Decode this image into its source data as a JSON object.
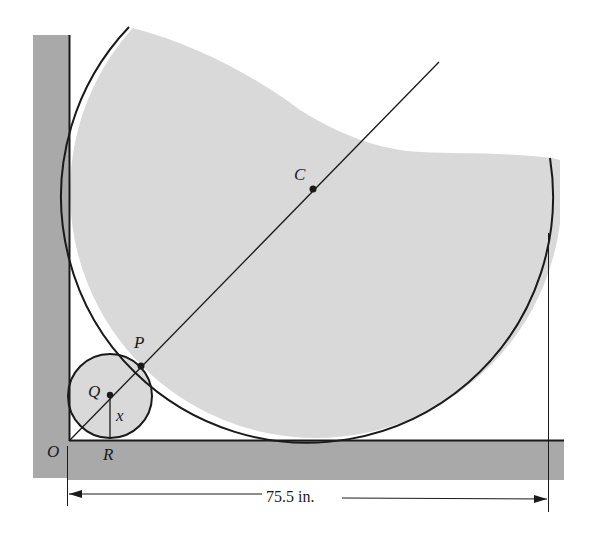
{
  "figure": {
    "type": "geometry-diagram",
    "colors": {
      "wall": "#a9a9a9",
      "fill": "#d9d9d9",
      "stroke": "#1a1a1a",
      "background": "#ffffff"
    }
  },
  "labels": {
    "O": "O",
    "R": "R",
    "Q": "Q",
    "P": "P",
    "C": "C",
    "x": "x"
  },
  "dimension": {
    "text": "75.5 in."
  },
  "points": {
    "O": {
      "desc": "corner of wall and floor"
    },
    "R": {
      "desc": "tangent point of small circle on floor"
    },
    "Q": {
      "desc": "center of small circle"
    },
    "P": {
      "desc": "tangent point between small and large circle"
    },
    "C": {
      "desc": "center of large circle"
    }
  }
}
